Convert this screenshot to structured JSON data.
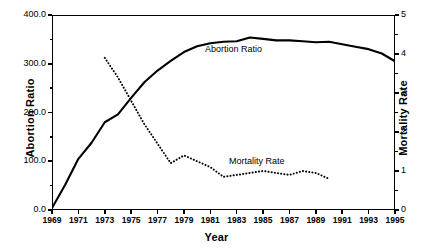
{
  "chart_data": {
    "type": "line",
    "title": "",
    "xlabel": "Year",
    "ylabel": "Abortion Ratio",
    "ylabel_right": "Mortality Rate",
    "xlim": [
      1969,
      1995
    ],
    "ylim": [
      0.0,
      400.0
    ],
    "ylim_right": [
      0,
      5
    ],
    "grid": false,
    "legend": "inline-labels",
    "x_tick_labels": [
      "1969",
      "1971",
      "1973",
      "1975",
      "1977",
      "1979",
      "1981",
      "1983",
      "1985",
      "1987",
      "1989",
      "1991",
      "1993",
      "1995"
    ],
    "x_tick_values": [
      1969,
      1971,
      1973,
      1975,
      1977,
      1979,
      1981,
      1983,
      1985,
      1987,
      1989,
      1991,
      1993,
      1995
    ],
    "y_tick_labels_left": [
      "400.0",
      "300.0",
      "200.0",
      "100.0",
      "0.0"
    ],
    "y_tick_values_left": [
      400.0,
      300.0,
      200.0,
      100.0,
      0.0
    ],
    "y_tick_labels_right": [
      "5",
      "4",
      "3",
      "2",
      "1",
      "0"
    ],
    "y_tick_values_right": [
      5,
      4,
      3,
      2,
      1,
      0
    ],
    "series": [
      {
        "name": "Abortion Ratio",
        "axis": "left",
        "style": "solid",
        "inline_label": "Abortion Ratio",
        "x": [
          1969,
          1970,
          1971,
          1972,
          1973,
          1974,
          1975,
          1976,
          1977,
          1978,
          1979,
          1980,
          1981,
          1982,
          1983,
          1984,
          1985,
          1986,
          1987,
          1988,
          1989,
          1990,
          1991,
          1992,
          1993,
          1994,
          1995
        ],
        "y": [
          4,
          52,
          105,
          138,
          180,
          196,
          230,
          262,
          286,
          306,
          324,
          336,
          342,
          345,
          346,
          354,
          351,
          348,
          348,
          346,
          344,
          345,
          340,
          335,
          330,
          321,
          305
        ]
      },
      {
        "name": "Mortality Rate",
        "axis": "right",
        "style": "dotted",
        "inline_label": "Mortality Rate",
        "x": [
          1973,
          1974,
          1975,
          1976,
          1977,
          1978,
          1979,
          1980,
          1981,
          1982,
          1983,
          1984,
          1985,
          1986,
          1987,
          1988,
          1989,
          1990
        ],
        "y": [
          3.9,
          3.4,
          2.8,
          2.2,
          1.7,
          1.2,
          1.4,
          1.25,
          1.1,
          0.85,
          0.9,
          0.95,
          1.0,
          0.95,
          0.9,
          1.0,
          0.95,
          0.8
        ]
      }
    ]
  }
}
